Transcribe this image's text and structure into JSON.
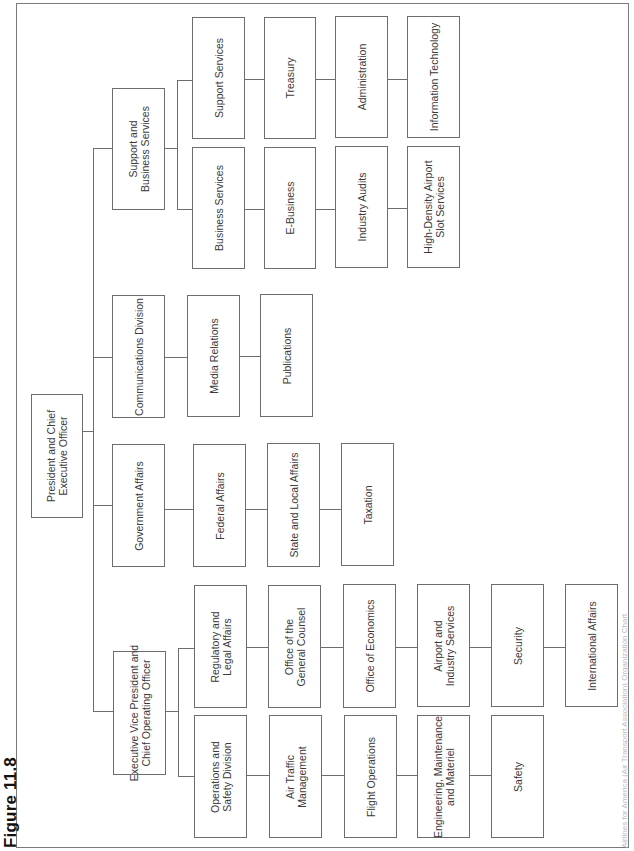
{
  "figure_label": "Figure 11.8",
  "caption": "Airlines for America (Air Transport Association) Organization Chart",
  "root": {
    "label": "President and Chief\nExecutive Officer"
  },
  "divisions": {
    "evp": {
      "label": "Executive Vice President and\nChief Operating Officer",
      "left_column": [
        "Operations and\nSafety Division",
        "Air Traffic\nManagement",
        "Flight Operations",
        "Engineering, Maintenance\nand Materiel",
        "Safety"
      ],
      "right_column": [
        "Regulatory and\nLegal Affairs",
        "Office of the\nGeneral Counsel",
        "Office of Economics",
        "Airport and\nIndustry Services",
        "Security",
        "International Affairs"
      ]
    },
    "government": {
      "label": "Government Affairs",
      "chain": [
        "Federal Affairs",
        "State and Local Affairs",
        "Taxation"
      ]
    },
    "communications": {
      "label": "Communications Division",
      "chain": [
        "Media Relations",
        "Publications"
      ]
    },
    "support": {
      "label": "Support and\nBusiness Services",
      "business_column": [
        "Business Services",
        "E-Business",
        "Industry Audits",
        "High-Density Airport\nSlot Services"
      ],
      "support_column": [
        "Support Services",
        "Treasury",
        "Administration",
        "Information Technology"
      ]
    }
  }
}
